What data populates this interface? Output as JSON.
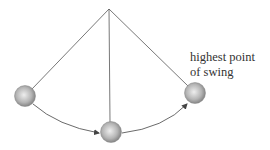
{
  "diagram": {
    "label": {
      "line1": "highest point",
      "line2": "of swing"
    },
    "colors": {
      "string": "#555555",
      "bob_light": "#e8e8e8",
      "bob_dark": "#8a8a8a",
      "arrow": "#444444"
    }
  }
}
